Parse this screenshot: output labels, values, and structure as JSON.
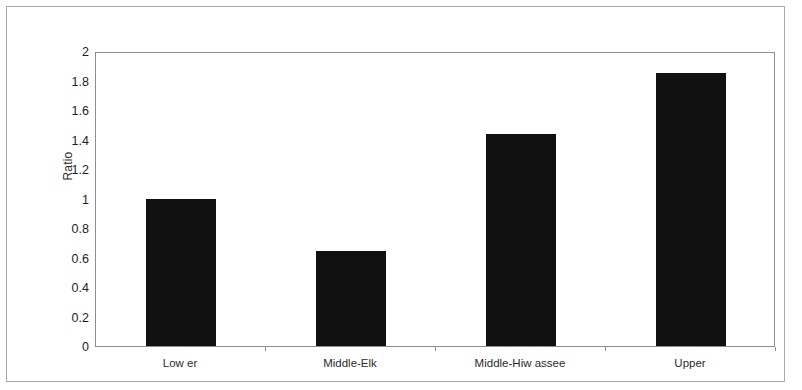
{
  "chart_data": {
    "type": "bar",
    "title": "",
    "subtitle": "",
    "xlabel": "",
    "ylabel": "Ratio",
    "categories": [
      "Low er",
      "Middle-Elk",
      "Middle-Hiw assee",
      "Upper"
    ],
    "values": [
      1.0,
      0.645,
      1.44,
      1.85
    ],
    "ylim": [
      0,
      2
    ],
    "ytick_step": 0.2,
    "ytick_labels": [
      "2",
      "1.8",
      "1.6",
      "1.4",
      "1.2",
      "1",
      "0.8",
      "0.6",
      "0.4",
      "0.2",
      "0"
    ],
    "ytick_values": [
      2,
      1.8,
      1.6,
      1.4,
      1.2,
      1,
      0.8,
      0.6,
      0.4,
      0.2,
      0
    ],
    "grid": false,
    "legend": null,
    "legend_position": "none",
    "bar_color": "#111111",
    "plot_border_color": "#8e8e8e",
    "figure_border_color": "#a8a8a8",
    "background_color": "#ffffff",
    "bar_width_fraction": 0.41
  }
}
